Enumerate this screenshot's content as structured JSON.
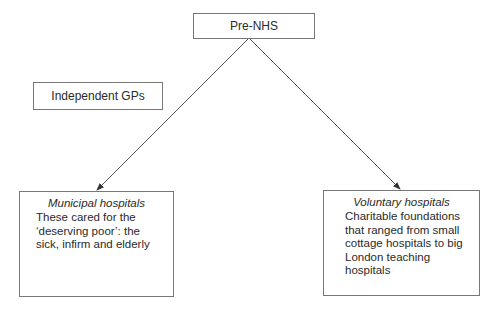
{
  "diagram": {
    "root": {
      "label": "Pre-NHS"
    },
    "side_node": {
      "label": "Independent GPs"
    },
    "children": [
      {
        "title": "Municipal hospitals",
        "body": "These cared for the ‘deserving poor’: the sick, infirm and elderly"
      },
      {
        "title": "Voluntary hospitals",
        "body": "Charitable foundations that ranged from small cottage hospitals to big London teaching hospitals"
      }
    ],
    "edges": [
      {
        "from": "Pre-NHS",
        "to": "Municipal hospitals"
      },
      {
        "from": "Pre-NHS",
        "to": "Voluntary hospitals"
      }
    ]
  }
}
